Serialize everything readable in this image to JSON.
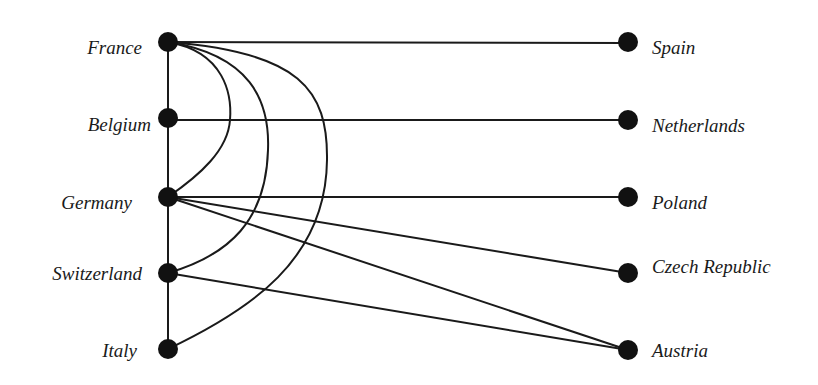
{
  "diagram": {
    "type": "bipartite-graph",
    "left_nodes": [
      {
        "id": "france",
        "label": "France",
        "x": 168,
        "y": 42
      },
      {
        "id": "belgium",
        "label": "Belgium",
        "x": 168,
        "y": 118
      },
      {
        "id": "germany",
        "label": "Germany",
        "x": 168,
        "y": 197
      },
      {
        "id": "switzerland",
        "label": "Switzerland",
        "x": 168,
        "y": 273
      },
      {
        "id": "italy",
        "label": "Italy",
        "x": 168,
        "y": 349
      }
    ],
    "right_nodes": [
      {
        "id": "spain",
        "label": "Spain",
        "x": 628,
        "y": 42
      },
      {
        "id": "netherlands",
        "label": "Netherlands",
        "x": 628,
        "y": 120
      },
      {
        "id": "poland",
        "label": "Poland",
        "x": 628,
        "y": 197
      },
      {
        "id": "czech",
        "label": "Czech Republic",
        "x": 628,
        "y": 273
      },
      {
        "id": "austria",
        "label": "Austria",
        "x": 628,
        "y": 350
      }
    ],
    "edges": [
      {
        "from": "france",
        "to": "belgium",
        "shape": "straight"
      },
      {
        "from": "belgium",
        "to": "germany",
        "shape": "straight"
      },
      {
        "from": "germany",
        "to": "switzerland",
        "shape": "straight"
      },
      {
        "from": "switzerland",
        "to": "italy",
        "shape": "straight"
      },
      {
        "from": "france",
        "to": "spain",
        "shape": "straight"
      },
      {
        "from": "belgium",
        "to": "netherlands",
        "shape": "straight"
      },
      {
        "from": "germany",
        "to": "poland",
        "shape": "straight"
      },
      {
        "from": "germany",
        "to": "czech",
        "shape": "straight"
      },
      {
        "from": "germany",
        "to": "austria",
        "shape": "straight"
      },
      {
        "from": "switzerland",
        "to": "austria",
        "shape": "straight"
      },
      {
        "from": "france",
        "to": "germany",
        "shape": "curve"
      },
      {
        "from": "france",
        "to": "switzerland",
        "shape": "curve"
      },
      {
        "from": "france",
        "to": "italy",
        "shape": "curve"
      }
    ],
    "colors": {
      "node": "#111111",
      "edge": "#1a1a1a",
      "label": "#1a1a1a",
      "background": "#ffffff"
    }
  }
}
